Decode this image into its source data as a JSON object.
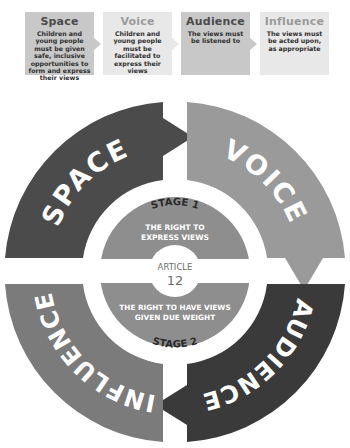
{
  "legend": [
    {
      "title": "Space",
      "description": "Children and young people must be given safe, inclusive opportunities to form and express their views",
      "tone": "dark"
    },
    {
      "title": "Voice",
      "description": "Children and young people must be facilitated to express their views",
      "tone": "light"
    },
    {
      "title": "Audience",
      "description": "The views must be listened to",
      "tone": "dark"
    },
    {
      "title": "Influence",
      "description": "The views must be acted upon, as appropriate",
      "tone": "light"
    }
  ],
  "ring": {
    "segments": [
      {
        "label": "SPACE",
        "color": "#4b4b4b"
      },
      {
        "label": "VOICE",
        "color": "#9a9a9a"
      },
      {
        "label": "AUDIENCE",
        "color": "#3a3a3a"
      },
      {
        "label": "INFLUENCE",
        "color": "#7b7b7b"
      }
    ]
  },
  "center": {
    "stage1_label": "STAGE 1",
    "stage1_line1": "THE RIGHT TO",
    "stage1_line2": "EXPRESS VIEWS",
    "article_label": "ARTICLE",
    "article_number": "12",
    "stage2_line1": "THE RIGHT TO HAVE VIEWS",
    "stage2_line2": "GIVEN DUE WEIGHT",
    "stage2_label": "STAGE 2",
    "disc_color": "#8e8e8e"
  }
}
